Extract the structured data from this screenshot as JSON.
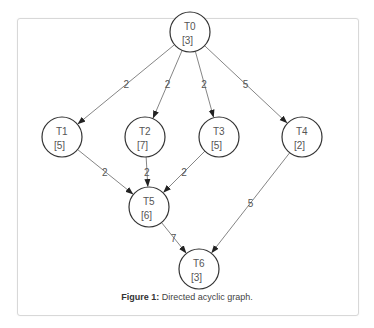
{
  "figure": {
    "caption_label": "Figure 1:",
    "caption_text": " Directed acyclic graph."
  },
  "graph": {
    "nodes": [
      {
        "id": "T0",
        "label": "T0",
        "weight": "[3]",
        "x": 190,
        "y": 32
      },
      {
        "id": "T1",
        "label": "T1",
        "weight": "[5]",
        "x": 62,
        "y": 137
      },
      {
        "id": "T2",
        "label": "T2",
        "weight": "[7]",
        "x": 145,
        "y": 137
      },
      {
        "id": "T3",
        "label": "T3",
        "weight": "[5]",
        "x": 219,
        "y": 137
      },
      {
        "id": "T4",
        "label": "T4",
        "weight": "[2]",
        "x": 302,
        "y": 137
      },
      {
        "id": "T5",
        "label": "T5",
        "weight": "[6]",
        "x": 149,
        "y": 207
      },
      {
        "id": "T6",
        "label": "T6",
        "weight": "[3]",
        "x": 199,
        "y": 269
      }
    ],
    "edges": [
      {
        "from": "T0",
        "to": "T1",
        "label": "2"
      },
      {
        "from": "T0",
        "to": "T2",
        "label": "2"
      },
      {
        "from": "T0",
        "to": "T3",
        "label": "2"
      },
      {
        "from": "T0",
        "to": "T4",
        "label": "5"
      },
      {
        "from": "T1",
        "to": "T5",
        "label": "2"
      },
      {
        "from": "T2",
        "to": "T5",
        "label": "2"
      },
      {
        "from": "T3",
        "to": "T5",
        "label": "2"
      },
      {
        "from": "T4",
        "to": "T6",
        "label": "5"
      },
      {
        "from": "T5",
        "to": "T6",
        "label": "7"
      }
    ]
  }
}
